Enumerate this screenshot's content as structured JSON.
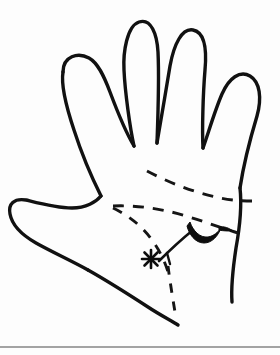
{
  "figure": {
    "background_color": "#fdfdfd",
    "ink_color": "#111111",
    "caption": "",
    "width": 280,
    "height": 355
  },
  "annotations": {
    "asterisk_marker": {
      "label": "*",
      "x": 151,
      "y": 259,
      "meaning": "marked point on palm"
    },
    "solid_mark": {
      "label": "",
      "x": 200,
      "y": 231,
      "meaning": "filled crescent mark"
    }
  },
  "creases": [
    {
      "name": "upper-dashed-crease",
      "style": "dashed"
    },
    {
      "name": "middle-dashed-crease",
      "style": "dashed"
    },
    {
      "name": "lower-dashed-crease",
      "style": "dashed"
    },
    {
      "name": "vertical-dashed-crease",
      "style": "dashed"
    }
  ],
  "separator": {
    "name": "bottom-rule",
    "y": 347,
    "color": "#4a4a4a"
  }
}
